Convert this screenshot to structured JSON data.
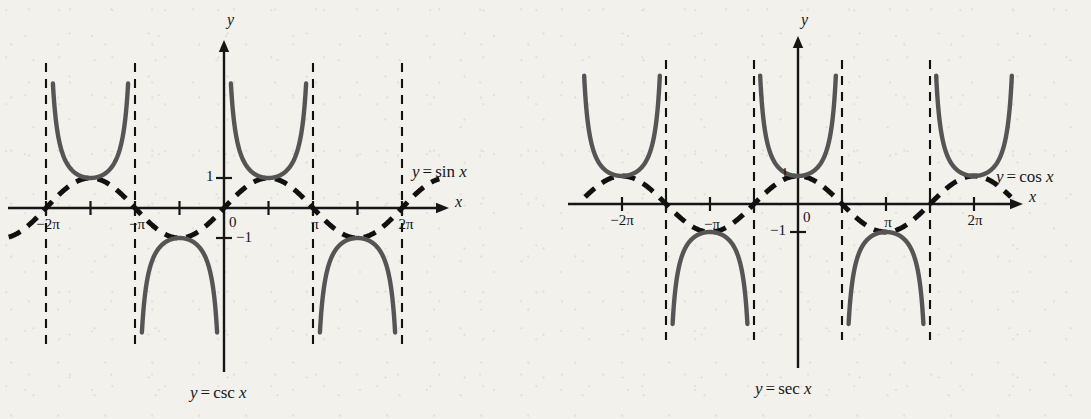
{
  "figure": {
    "background_color": "#f2f1ec",
    "curve_color": "#555555",
    "axis_color": "#161616",
    "dashed_color": "#111111"
  },
  "panels": [
    {
      "id": "csc",
      "caption": {
        "lhs": "y",
        "op": "=",
        "fn": "csc",
        "arg": "x"
      },
      "axis_x_label": "x",
      "axis_y_label": "y",
      "curve_label": {
        "lhs": "y",
        "op": "=",
        "fn": "sin",
        "arg": "x"
      },
      "x_tick_labels": [
        {
          "text": "−2π",
          "x_value": -6.2832
        },
        {
          "text": "−π",
          "x_value": -3.1416
        },
        {
          "text": "π",
          "x_value": 3.1416
        },
        {
          "text": "2π",
          "x_value": 6.2832
        }
      ],
      "y_tick_labels": [
        {
          "text": "1",
          "y_value": 1
        },
        {
          "text": "−1",
          "y_value": -1
        }
      ],
      "origin_label": "0",
      "chart_data": {
        "type": "line",
        "title": "y = csc x",
        "xlabel": "x",
        "ylabel": "y",
        "xlim": [
          -7.6,
          7.6
        ],
        "ylim": [
          -5.0,
          5.0
        ],
        "grid": false,
        "legend": [
          "y = sin x",
          "y = csc x"
        ],
        "xticks": [
          -6.2832,
          -4.7124,
          -3.1416,
          -1.5708,
          0,
          1.5708,
          3.1416,
          4.7124,
          6.2832
        ],
        "xticklabels": [
          "−2π",
          "",
          "−π",
          "",
          "0",
          "",
          "π",
          "",
          "2π"
        ],
        "yticks": [
          -1,
          1
        ],
        "yticklabels": [
          "−1",
          "1"
        ],
        "asymptotes": [
          -6.2832,
          -3.1416,
          3.1416,
          6.2832
        ],
        "series": [
          {
            "name": "y = sin x",
            "style": "dashed",
            "function": "sin",
            "domain": [
              -7.6,
              7.6
            ]
          },
          {
            "name": "y = csc x",
            "style": "solid",
            "function": "csc",
            "branches": [
              [
                -6.2832,
                -3.1416
              ],
              [
                -3.1416,
                0.0
              ],
              [
                0.0,
                3.1416
              ],
              [
                3.1416,
                6.2832
              ]
            ]
          }
        ]
      }
    },
    {
      "id": "sec",
      "caption": {
        "lhs": "y",
        "op": "=",
        "fn": "sec",
        "arg": "x"
      },
      "axis_x_label": "x",
      "axis_y_label": "y",
      "curve_label": {
        "lhs": "y",
        "op": "=",
        "fn": "cos",
        "arg": "x"
      },
      "x_tick_labels": [
        {
          "text": "−2π",
          "x_value": -6.2832
        },
        {
          "text": "−π",
          "x_value": -3.1416
        },
        {
          "text": "π",
          "x_value": 3.1416
        },
        {
          "text": "2π",
          "x_value": 6.2832
        }
      ],
      "y_tick_labels": [
        {
          "text": "1",
          "y_value": 1
        },
        {
          "text": "−1",
          "y_value": -1
        }
      ],
      "origin_label": "0",
      "chart_data": {
        "type": "line",
        "title": "y = sec x",
        "xlabel": "x",
        "ylabel": "y",
        "xlim": [
          -7.6,
          7.6
        ],
        "ylim": [
          -5.0,
          5.0
        ],
        "grid": false,
        "legend": [
          "y = cos x",
          "y = sec x"
        ],
        "xticks": [
          -6.2832,
          -4.7124,
          -3.1416,
          -1.5708,
          0,
          1.5708,
          3.1416,
          4.7124,
          6.2832
        ],
        "xticklabels": [
          "−2π",
          "",
          "−π",
          "",
          "0",
          "",
          "π",
          "",
          "2π"
        ],
        "yticks": [
          -1,
          1
        ],
        "yticklabels": [
          "−1",
          "1"
        ],
        "asymptotes": [
          -4.7124,
          -1.5708,
          1.5708,
          4.7124
        ],
        "series": [
          {
            "name": "y = cos x",
            "style": "dashed",
            "function": "cos",
            "domain": [
              -7.6,
              7.6
            ]
          },
          {
            "name": "y = sec x",
            "style": "solid",
            "function": "sec",
            "branches": [
              [
                -7.854,
                -4.7124
              ],
              [
                -4.7124,
                -1.5708
              ],
              [
                -1.5708,
                1.5708
              ],
              [
                1.5708,
                4.7124
              ],
              [
                4.7124,
                7.854
              ]
            ]
          }
        ]
      }
    }
  ],
  "geometry": {
    "csc": {
      "ox": 224,
      "oy": 208,
      "px": 44.5,
      "unit_y": 30,
      "x_arrow_end": 449,
      "x_left_end": 8,
      "y_arrow_top": 40,
      "y_bottom": 372,
      "dash_top": 63,
      "dash_bottom": 344,
      "clip_top": 80,
      "clip_bottom": 336
    },
    "sec": {
      "ox": 252,
      "oy": 204,
      "px": 44.0,
      "unit_y": 28,
      "x_arrow_end": 477,
      "x_left_end": 22,
      "y_arrow_top": 36,
      "y_bottom": 368,
      "dash_top": 60,
      "dash_bottom": 340,
      "clip_top": 72,
      "clip_bottom": 328
    }
  }
}
